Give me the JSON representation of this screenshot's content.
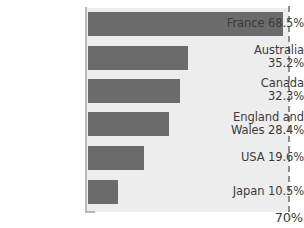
{
  "chart_data": {
    "type": "bar",
    "orientation": "horizontal",
    "title": "",
    "xlabel": "",
    "ylabel": "",
    "categories": [
      "France",
      "Australia",
      "Canada",
      "England and Wales",
      "USA",
      "Japan"
    ],
    "values": [
      68.5,
      35.2,
      32.3,
      28.4,
      19.6,
      10.5
    ],
    "value_suffix": "%",
    "xlim": [
      0,
      70
    ],
    "axis_max_label": "70%",
    "grid": false,
    "legend": null,
    "reference_line_at": 70,
    "reference_line_style": "dashed",
    "bar_color": "#6b6b6b",
    "plot_background": "#ededed",
    "axis_color": "#b9b9b9",
    "text_color": "#3b3b3b"
  },
  "labels": {
    "france": {
      "line1": "France 68.5%",
      "line2": ""
    },
    "australia": {
      "line1": "Australia",
      "line2": "35.2%"
    },
    "canada": {
      "line1": "Canada",
      "line2": "32.3%"
    },
    "england_wales": {
      "line1": "England and",
      "line2": "Wales 28.4%"
    },
    "usa": {
      "line1": "USA 19.6%",
      "line2": ""
    },
    "japan": {
      "line1": "Japan 10.5%",
      "line2": ""
    }
  },
  "axis": {
    "max_label": "70%"
  }
}
